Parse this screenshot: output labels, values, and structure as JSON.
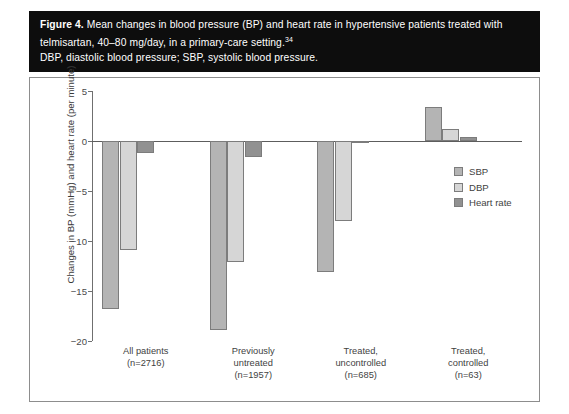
{
  "caption": {
    "figure_label": "Figure 4.",
    "line1_rest": " Mean changes in blood pressure (BP) and heart rate in hypertensive patients treated with",
    "line2": "telmisartan, 40–80 mg/day, in a primary-care setting.",
    "line2_superscript": "34",
    "line3": "DBP, diastolic blood pressure; SBP, systolic blood pressure."
  },
  "colors": {
    "caption_background": "#0d0d0d",
    "caption_text": "#ffffff",
    "plot_background": "#ffffff",
    "frame_border": "#8d8d8d",
    "axis": "#6f6f6f",
    "sbp": "#b4b4b4",
    "dbp": "#d6d6d6",
    "heart_rate": "#919191",
    "bar_outline": "#7c7c7c"
  },
  "chart_data": {
    "type": "bar",
    "title": "",
    "xlabel": "",
    "ylabel": "Changes in BP (mmHg) and heart rate (per minute)",
    "ylim": [
      -20,
      5
    ],
    "yticks": [
      5,
      0,
      -5,
      -10,
      -15,
      -20
    ],
    "ytick_labels": [
      "5",
      "0",
      "−5",
      "−10",
      "−15",
      "−20"
    ],
    "grid": false,
    "legend_position": "top-right",
    "categories": [
      "All patients\n(n=2716)",
      "Previously\nuntreated\n(n=1957)",
      "Treated,\nuncontrolled\n(n=685)",
      "Treated,\ncontrolled\n(n=63)"
    ],
    "category_lines": [
      [
        "All patients",
        "(n=2716)"
      ],
      [
        "Previously",
        "untreated",
        "(n=1957)"
      ],
      [
        "Treated,",
        "uncontrolled",
        "(n=685)"
      ],
      [
        "Treated,",
        "controlled",
        "(n=63)"
      ]
    ],
    "series": [
      {
        "name": "SBP",
        "color": "#b4b4b4",
        "values": [
          -16.8,
          -18.9,
          -13.1,
          3.4
        ]
      },
      {
        "name": "DBP",
        "color": "#d6d6d6",
        "values": [
          -10.9,
          -12.1,
          -8.0,
          1.2
        ]
      },
      {
        "name": "Heart rate",
        "color": "#919191",
        "values": [
          -1.2,
          -1.6,
          -0.1,
          0.4
        ]
      }
    ]
  },
  "legend": {
    "items": [
      {
        "label": "SBP",
        "color": "#b4b4b4"
      },
      {
        "label": "DBP",
        "color": "#d6d6d6"
      },
      {
        "label": "Heart rate",
        "color": "#919191"
      }
    ]
  }
}
